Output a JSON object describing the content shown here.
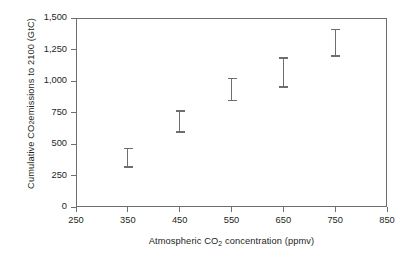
{
  "chart_data": {
    "type": "scatter",
    "title": "",
    "xlabel": "Atmospheric CO2 concentration (ppmv)",
    "xlabel_parts": {
      "pre": "Atmospheric CO",
      "sub": "2",
      "post": " concentration (ppmv)"
    },
    "ylabel": "Cumulative CO2 emissions to 2100 (GtC)",
    "ylabel_parts": {
      "pre": "Cumulative CO",
      "sub": "2",
      "post": " emissions to 2100 (GtC)"
    },
    "xlim": [
      250,
      850
    ],
    "ylim": [
      0,
      1500
    ],
    "xticks": [
      250,
      350,
      450,
      550,
      650,
      750,
      850
    ],
    "xtick_labels": [
      "250",
      "350",
      "450",
      "550",
      "650",
      "750",
      "850"
    ],
    "yticks": [
      0,
      250,
      500,
      750,
      1000,
      1250,
      1500
    ],
    "ytick_labels": [
      "0",
      "250",
      "500",
      "750",
      "1,000",
      "1,250",
      "1,500"
    ],
    "grid": false,
    "legend": "none",
    "series": [
      {
        "name": "Cumulative emissions range",
        "marker": "error-bar",
        "color": "#6d6e71",
        "points": [
          {
            "x": 350,
            "low": 310,
            "high": 470,
            "mid": 390
          },
          {
            "x": 450,
            "low": 590,
            "high": 770,
            "mid": 680
          },
          {
            "x": 550,
            "low": 840,
            "high": 1025,
            "mid": 930
          },
          {
            "x": 650,
            "low": 945,
            "high": 1190,
            "mid": 1070
          },
          {
            "x": 750,
            "low": 1190,
            "high": 1415,
            "mid": 1300
          }
        ]
      }
    ],
    "axis_color": "#6d6e71",
    "background": "#ffffff"
  }
}
